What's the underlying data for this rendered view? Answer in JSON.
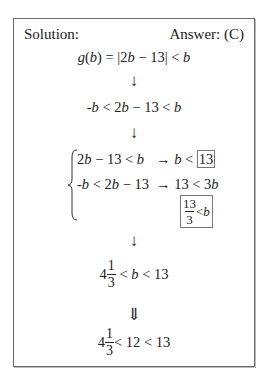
{
  "header": {
    "solution_label": "Solution:",
    "answer_label": "Answer: (C)"
  },
  "steps": {
    "step1": {
      "lhs": "g(b) = |2b − 13| < b"
    },
    "arrow1": "↓",
    "step2": "-b < 2b − 13 < b",
    "arrow2": "↓",
    "system": {
      "row1": {
        "left": "2b − 13 < b",
        "arrow": "→",
        "result_prefix": "b <",
        "result_boxed": "13"
      },
      "row2": {
        "left": "-b < 2b − 13",
        "arrow": "→",
        "result": "13 < 3b"
      },
      "row3": {
        "boxed_num": "13",
        "boxed_den": "3",
        "boxed_tail": "<b"
      }
    },
    "arrow3": "↓",
    "step4": {
      "whole": "4",
      "num": "1",
      "den": "3",
      "tail": "< b < 13"
    },
    "arrow4": "⇓",
    "step5": {
      "whole": "4",
      "num": "1",
      "den": "3",
      "tail": "< 12 < 13"
    }
  }
}
